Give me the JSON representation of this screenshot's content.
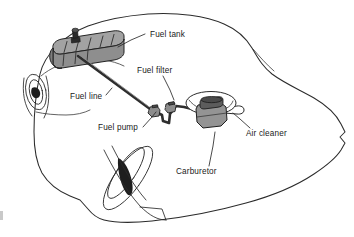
{
  "figure": {
    "subject": "car",
    "view": "three-quarter see-through body",
    "background_color": "#ffffff",
    "line_color": "#2b2b2b"
  },
  "labels": [
    {
      "id": "fuel-tank",
      "text": "Fuel tank",
      "x": 150,
      "y": 37,
      "anchor": "start",
      "leader": "M 145 34 L 131 40 L 118 47",
      "points_to": "fuel tank top rear corner"
    },
    {
      "id": "fuel-filter",
      "text": "Fuel filter",
      "x": 137,
      "y": 73,
      "anchor": "start",
      "leader": "M 163 76 L 170 90 L 174 100",
      "points_to": "inline fuel filter"
    },
    {
      "id": "fuel-line",
      "text": "Fuel line",
      "x": 70,
      "y": 99,
      "anchor": "start",
      "leader": "M 106 95 L 112 88",
      "points_to": "fuel line tube"
    },
    {
      "id": "fuel-pump",
      "text": "Fuel pump",
      "x": 98,
      "y": 130,
      "anchor": "start",
      "leader": "M 143 127 L 152 117 L 156 112",
      "points_to": "fuel pump body"
    },
    {
      "id": "carburetor",
      "text": "Carburetor",
      "x": 176,
      "y": 174,
      "anchor": "start",
      "leader": "M 209 166 L 213 146 L 215 132",
      "points_to": "carburetor body"
    },
    {
      "id": "air-cleaner",
      "text": "Air cleaner",
      "x": 246,
      "y": 136,
      "anchor": "start",
      "leader": "M 250 128 L 240 119 L 233 113",
      "points_to": "air cleaner snorkel"
    }
  ],
  "components": {
    "fuel_tank": {
      "name": "Fuel tank",
      "color": "#a2a2a2",
      "shading_color": "#8e8e8e",
      "rib_count": 5,
      "has_filler_neck": true
    },
    "fuel_line": {
      "name": "Fuel line",
      "color": "#2e2e2e",
      "highlight_color": "#8d8d8d"
    },
    "fuel_pump": {
      "name": "Fuel pump",
      "color": "#8c8c8c"
    },
    "fuel_filter": {
      "name": "Fuel filter",
      "color": "#8c8c8c"
    },
    "carburetor": {
      "name": "Carburetor",
      "color": "#949494",
      "top_color": "#5c5c5c"
    },
    "air_cleaner": {
      "name": "Air cleaner",
      "color": "#ffffff",
      "has_snorkel": true
    },
    "car_body": {
      "name": "Car body outline",
      "color": "#ffffff",
      "stroke": "#2b2b2b"
    },
    "rear_wheel": {
      "name": "Rear wheel",
      "stroke": "#2b2b2b"
    },
    "front_wheel": {
      "name": "Front wheel",
      "stroke": "#2b2b2b"
    }
  }
}
